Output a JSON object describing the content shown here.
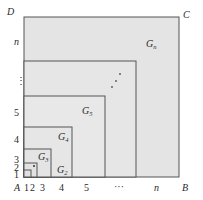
{
  "diagram": {
    "colors": {
      "fill": "#e4e4e4",
      "stroke": "#555555",
      "text": "#2a2a2a"
    },
    "corners": {
      "A": "A",
      "B": "B",
      "C": "C",
      "D": "D"
    },
    "x_axis_labels": [
      "1",
      "2",
      "3",
      "4",
      "5",
      "···",
      "n"
    ],
    "y_axis_labels": [
      "1",
      "2",
      "3",
      "4",
      "5",
      "⋮",
      "n"
    ],
    "regions": [
      {
        "letter": "G",
        "sub": "2"
      },
      {
        "letter": "G",
        "sub": "3"
      },
      {
        "letter": "G",
        "sub": "4"
      },
      {
        "letter": "G",
        "sub": "5"
      },
      {
        "letter": "G",
        "sub": "n"
      }
    ],
    "diagonal_dots": "⋰"
  }
}
